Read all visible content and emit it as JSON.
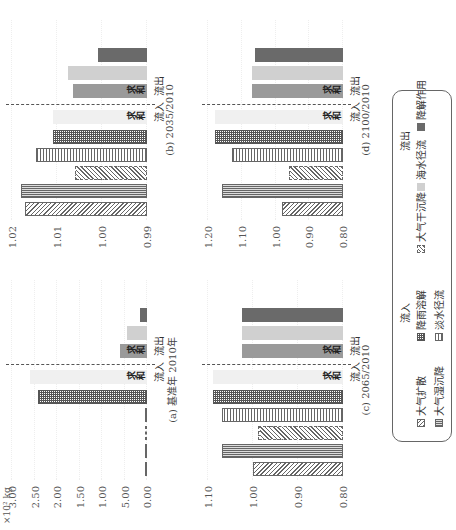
{
  "figure": {
    "unit_label": "×10² kg",
    "group_labels": {
      "inflow": "流入",
      "outflow": "流出",
      "sum": "求和"
    }
  },
  "chart_data": [
    {
      "type": "bar",
      "title": "(a) 基准年 2010年",
      "ylabel": "×10² kg",
      "yticks": [
        "0.00",
        "5.00",
        "1.00",
        "1.50",
        "2.00",
        "2.50",
        "3.00"
      ],
      "ylim": [
        0,
        3.0
      ],
      "categories": [
        "大气扩散",
        "大气湿沉降",
        "大气干沉降",
        "淡水径流",
        "降雨溶解",
        "流入求和",
        "流出求和",
        "海水径流",
        "降解作用"
      ],
      "values": [
        0.05,
        0.03,
        0.0,
        0.0,
        2.43,
        2.6,
        0.6,
        0.45,
        0.15
      ]
    },
    {
      "type": "bar",
      "title": "(b) 2035/2010",
      "yticks": [
        "0.99",
        "1.00",
        "1.01",
        "1.02"
      ],
      "ylim": [
        0.99,
        1.02
      ],
      "categories": [
        "大气扩散",
        "大气湿沉降",
        "大气干沉降",
        "淡水径流",
        "降雨溶解",
        "流入求和",
        "流出求和",
        "海水径流",
        "降解作用"
      ],
      "values": [
        1.0172,
        1.018,
        1.006,
        1.0147,
        1.011,
        1.011,
        1.0065,
        1.0075,
        1.001
      ]
    },
    {
      "type": "bar",
      "title": "(c) 2065/2010",
      "yticks": [
        "0.80",
        "0.90",
        "1.00",
        "1.10"
      ],
      "ylim": [
        0.8,
        1.1
      ],
      "categories": [
        "大气扩散",
        "大气湿沉降",
        "大气干沉降",
        "淡水径流",
        "降雨溶解",
        "流入求和",
        "流出求和",
        "海水径流",
        "降解作用"
      ],
      "values": [
        1.0,
        1.07,
        0.99,
        1.07,
        1.09,
        1.09,
        1.025,
        1.025,
        1.025
      ]
    },
    {
      "type": "bar",
      "title": "(d) 2100/2010",
      "yticks": [
        "0.80",
        "0.90",
        "1.00",
        "1.10",
        "1.20"
      ],
      "ylim": [
        0.8,
        1.2
      ],
      "categories": [
        "大气扩散",
        "大气湿沉降",
        "大气干沉降",
        "淡水径流",
        "降雨溶解",
        "流入求和",
        "流出求和",
        "海水径流",
        "降解作用"
      ],
      "values": [
        0.98,
        1.16,
        0.96,
        1.13,
        1.18,
        1.18,
        1.07,
        1.07,
        1.06
      ]
    }
  ],
  "legend": {
    "inflow_title": "流入",
    "outflow_title": "流出",
    "items": [
      {
        "label": "大气扩散",
        "pattern": "diag"
      },
      {
        "label": "降雨溶解",
        "pattern": "grid"
      },
      {
        "label": "大气干沉降",
        "pattern": "diag-dashed"
      },
      {
        "label": "大气湿沉降",
        "pattern": "vertical"
      },
      {
        "label": "淡水径流",
        "pattern": "horizontal"
      },
      {
        "label": "海水径流",
        "pattern": "light-gray"
      },
      {
        "label": "降解作用",
        "pattern": "dark-gray"
      }
    ]
  }
}
